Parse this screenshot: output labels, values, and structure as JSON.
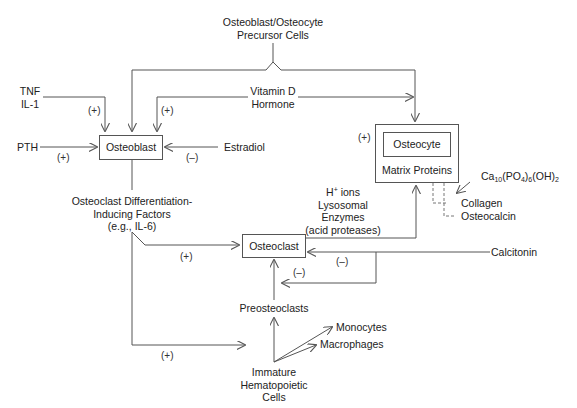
{
  "nodes": {
    "precursor": {
      "line1": "Osteoblast/Osteocyte",
      "line2": "Precursor Cells"
    },
    "tnf": {
      "line1": "TNF",
      "line2": "IL-1"
    },
    "pth": "PTH",
    "vitamin_d": {
      "line1": "Vitamin D",
      "line2": "Hormone"
    },
    "estradiol": "Estradiol",
    "osteoblast": "Osteoblast",
    "osteocyte": "Osteocyte",
    "matrix_proteins": "Matrix Proteins",
    "calcium_phosphate": {
      "base": "Ca",
      "s1": "10",
      "mid": "(PO",
      "s2": "4",
      "mid2": ")",
      "s3": "6",
      "end": "(OH)",
      "s4": "2"
    },
    "collagen": "Collagen",
    "osteocalcin": "Osteocalcin",
    "differentiation_factors": {
      "line1": "Osteoclast Differentiation-",
      "line2": "Inducing Factors",
      "line3": "(e.g., IL-6)"
    },
    "osteoclast_products": {
      "line1_base": "H",
      "line1_sup": "+",
      "line1_rest": " ions",
      "line2": "Lysosomal",
      "line3": "Enzymes",
      "line4": "(acid proteases)"
    },
    "osteoclast": "Osteoclast",
    "calcitonin": "Calcitonin",
    "preosteoclasts": "Preosteoclasts",
    "monocytes": "Monocytes",
    "macrophages": "Macrophages",
    "hematopoietic": {
      "line1": "Immature",
      "line2": "Hematopoietic",
      "line3": "Cells"
    }
  },
  "signs": {
    "tnf_to_osteoblast": "(+)",
    "vitd_to_osteoblast": "(+)",
    "pth_to_osteoblast": "(+)",
    "estradiol_to_osteoblast": "(–)",
    "vitd_to_osteocyte": "(+)",
    "factors_to_osteoclast": "(+)",
    "calcitonin_to_osteoclast": "(–)",
    "calcitonin_to_preosteoclast": "(–)",
    "factors_to_hematopoietic": "(+)"
  },
  "colors": {
    "line": "#555555",
    "text": "#222222",
    "dashed": "#777777"
  }
}
